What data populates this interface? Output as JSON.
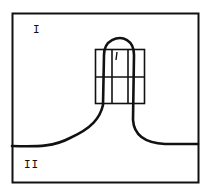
{
  "diagram": {
    "regions": [
      {
        "id": "I",
        "label": "I"
      },
      {
        "id": "II",
        "label": "II"
      }
    ],
    "grid": {
      "rows": 2,
      "cols": 3
    },
    "colors": {
      "stroke": "#111111",
      "background": "#ffffff"
    }
  }
}
